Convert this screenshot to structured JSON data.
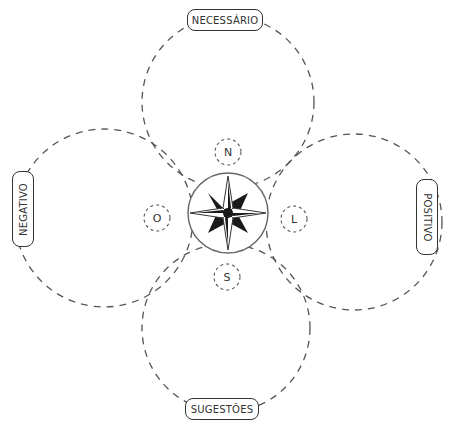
{
  "diagram": {
    "title": "",
    "labels": {
      "top": "NECESSÁRIO",
      "left": "NEGATIVO",
      "right": "POSITIVO",
      "bottom": "SUGESTÕES"
    },
    "directions": {
      "north": "N",
      "west": "O",
      "east": "L",
      "south": "S"
    },
    "center_icon": "compass-rose",
    "colors": {
      "stroke": "#555555",
      "text": "#333333",
      "compass_fill": "#1a1a1a",
      "background": "#ffffff"
    }
  }
}
